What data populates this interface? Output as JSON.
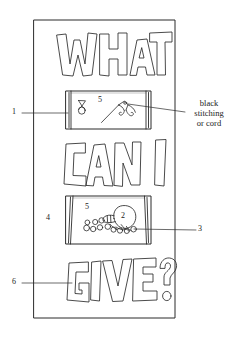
{
  "figure": {
    "kind": "patent-line-drawing",
    "title_words": [
      "WHAT",
      "CAN I",
      "GIVE?"
    ],
    "panel_border_color": "#2b2b2b",
    "line_color": "#2b2b2b",
    "background_color": "#ffffff"
  },
  "text_blocks": [
    {
      "id": "word_what",
      "value": "WHAT"
    },
    {
      "id": "word_can_i",
      "value": "CAN I"
    },
    {
      "id": "word_give",
      "value": "GIVE?"
    }
  ],
  "callouts": [
    {
      "id": "callout_cord",
      "label": "black stitching or cord",
      "line1": "black",
      "line2": "stitching",
      "line3": "or cord",
      "side": "right"
    }
  ],
  "reference_numerals": [
    {
      "id": "ref_1",
      "value": "1",
      "side": "left",
      "points_to": "upper-pocket-panel"
    },
    {
      "id": "ref_2",
      "value": "2",
      "side": "inline",
      "points_to": "coin-pouch"
    },
    {
      "id": "ref_3",
      "value": "3",
      "side": "right",
      "points_to": "coin"
    },
    {
      "id": "ref_4",
      "value": "4",
      "side": "inline",
      "points_to": "banner-backing"
    },
    {
      "id": "ref_5a",
      "value": "5",
      "side": "inline",
      "points_to": "upper-pocket-interior"
    },
    {
      "id": "ref_5b",
      "value": "5",
      "side": "inline",
      "points_to": "lower-pocket-interior"
    },
    {
      "id": "ref_6",
      "value": "6",
      "side": "left",
      "points_to": "letter-g"
    }
  ],
  "objects": [
    {
      "id": "banner-backing",
      "name": "rectangular banner backing",
      "numeral": "4"
    },
    {
      "id": "upper-pocket-panel",
      "name": "upper pocket panel",
      "numeral": "1"
    },
    {
      "id": "needle-and-cord",
      "name": "needle with curved cord",
      "numeral": "5"
    },
    {
      "id": "small-pouch",
      "name": "small drawstring pouch",
      "numeral": "5"
    },
    {
      "id": "lower-pocket-panel",
      "name": "lower pocket panel",
      "numeral": "4"
    },
    {
      "id": "coin-pouch",
      "name": "pouch spilling coins",
      "numeral": "2"
    },
    {
      "id": "coins",
      "name": "scattered coins",
      "numeral": "3"
    },
    {
      "id": "letters",
      "name": "applique block letters",
      "numeral": "6"
    }
  ]
}
